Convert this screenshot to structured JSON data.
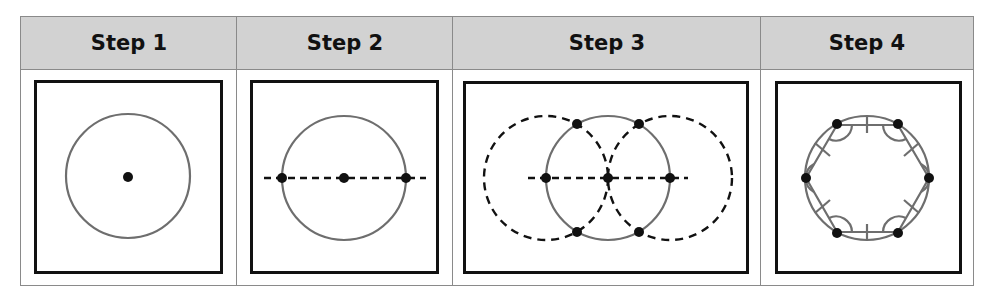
{
  "table": {
    "columns": [
      {
        "label": "Step 1",
        "description": "Draw a circle with a center point"
      },
      {
        "label": "Step 2",
        "description": "Draw a diameter through the center; mark its endpoints"
      },
      {
        "label": "Step 3",
        "description": "Draw two circles of same radius centered at the diameter endpoints; mark intersection points"
      },
      {
        "label": "Step 4",
        "description": "Connect the six points to form an inscribed regular hexagon with congruent sides and angles marked"
      }
    ]
  },
  "colors": {
    "header_bg": "#d2d2d2",
    "grid_line": "#8a8a8a",
    "circle_stroke": "#6e6e6e",
    "point_fill": "#111111",
    "box_border": "#111111"
  }
}
